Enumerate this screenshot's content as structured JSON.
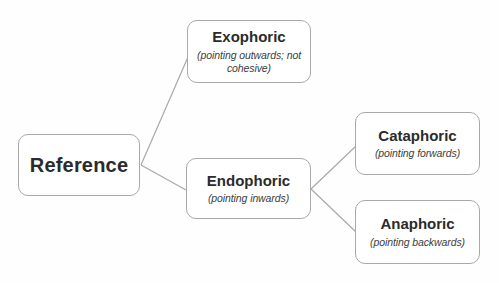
{
  "diagram": {
    "colors": {
      "background": "#fefefe",
      "box_fill": "#ffffff",
      "box_border": "#a9a9a9",
      "connector_line": "#a9a9a9",
      "title_text": "#2b2b2b",
      "subtitle_text": "#3d3d3d"
    },
    "root": {
      "label": "Reference"
    },
    "nodes": {
      "exophoric": {
        "title": "Exophoric",
        "subtitle": "(pointing outwards; not cohesive)"
      },
      "endophoric": {
        "title": "Endophoric",
        "subtitle": "(pointing inwards)"
      },
      "cataphoric": {
        "title": "Cataphoric",
        "subtitle": "(pointing forwards)"
      },
      "anaphoric": {
        "title": "Anaphoric",
        "subtitle": "(pointing backwards)"
      }
    },
    "edges": [
      {
        "from": "Reference",
        "to": "Exophoric"
      },
      {
        "from": "Reference",
        "to": "Endophoric"
      },
      {
        "from": "Endophoric",
        "to": "Cataphoric"
      },
      {
        "from": "Endophoric",
        "to": "Anaphoric"
      }
    ]
  }
}
